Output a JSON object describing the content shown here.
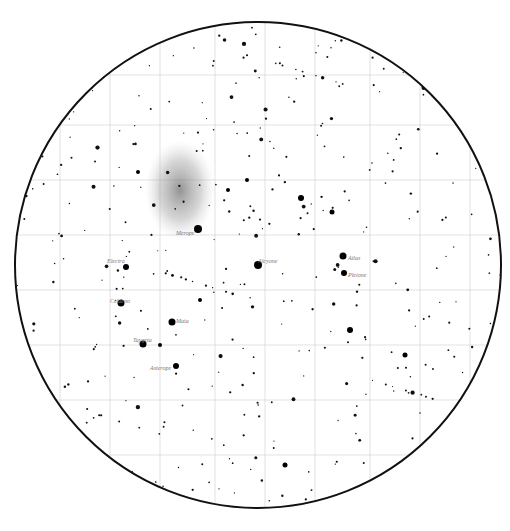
{
  "chart": {
    "circle": {
      "cx": 258,
      "cy": 265,
      "r": 243
    },
    "grid_x": [
      60,
      110,
      160,
      215,
      265,
      315,
      370,
      420,
      470
    ],
    "grid_y": [
      75,
      125,
      180,
      235,
      290,
      345,
      400,
      455
    ],
    "nebula": {
      "cx": 180,
      "cy": 190,
      "rx": 35,
      "ry": 50
    }
  },
  "labels": [
    {
      "text": "Merope",
      "x": 176,
      "y": 230
    },
    {
      "text": "Electra",
      "x": 107,
      "y": 258
    },
    {
      "text": "Alcyone",
      "x": 258,
      "y": 258
    },
    {
      "text": "Atlas",
      "x": 348,
      "y": 255
    },
    {
      "text": "Pleione",
      "x": 348,
      "y": 272
    },
    {
      "text": "Celaeno",
      "x": 110,
      "y": 298
    },
    {
      "text": "Maia",
      "x": 176,
      "y": 318
    },
    {
      "text": "Taygeta",
      "x": 133,
      "y": 337
    },
    {
      "text": "Asterope",
      "x": 150,
      "y": 365
    }
  ],
  "bright_stars": [
    [
      198,
      229,
      4
    ],
    [
      258,
      265,
      4
    ],
    [
      343,
      256,
      3.5
    ],
    [
      344,
      273,
      3
    ],
    [
      121,
      303,
      3.5
    ],
    [
      172,
      322,
      3.5
    ],
    [
      143,
      344,
      3.5
    ],
    [
      176,
      366,
      3
    ],
    [
      126,
      267,
      3
    ],
    [
      301,
      198,
      3
    ],
    [
      350,
      330,
      3
    ],
    [
      332,
      212,
      2.5
    ],
    [
      247,
      180,
      2
    ],
    [
      228,
      190,
      2
    ],
    [
      285,
      465,
      2.5
    ],
    [
      405,
      355,
      2.5
    ],
    [
      138,
      172,
      2
    ],
    [
      160,
      345,
      2
    ],
    [
      200,
      300,
      2
    ]
  ]
}
